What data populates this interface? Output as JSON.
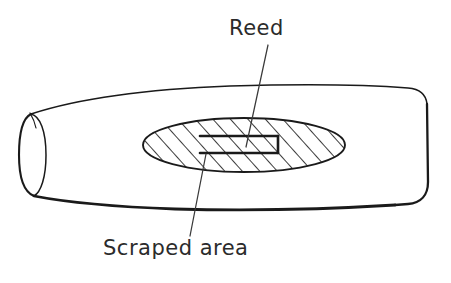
{
  "figure": {
    "title_visible": false,
    "stroke_color": "#1a1a1a",
    "background_color": "#ffffff",
    "text_color": "#2b2b2b"
  },
  "labels": {
    "reed": "Reed",
    "scraped_area": "Scraped area"
  },
  "parts": {
    "body": {
      "name": "tapered-tube-body",
      "open_end": "left"
    },
    "scraped_ellipse": {
      "name": "scraped-area-ellipse",
      "fill": "diagonal-hatching",
      "center_x": 244,
      "center_y": 145,
      "radius_x": 101,
      "radius_y": 27
    },
    "reed_rect": {
      "name": "reed-rectangle",
      "left": 200,
      "top": 136,
      "width": 78,
      "height": 17
    }
  },
  "leaders": [
    {
      "name": "reed-leader-line",
      "from_x": 268,
      "from_y": 45,
      "to_x": 246,
      "to_y": 147
    },
    {
      "name": "scraped-area-leader-line",
      "from_x": 206,
      "from_y": 154,
      "to_x": 190,
      "to_y": 236
    }
  ]
}
